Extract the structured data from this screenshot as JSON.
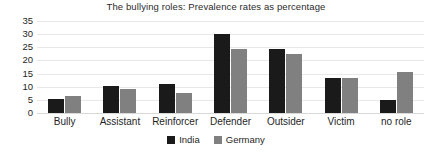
{
  "chart_data": {
    "type": "bar",
    "title": "The bullying roles: Prevalence rates as percentage",
    "xlabel": "",
    "ylabel": "",
    "categories": [
      "Bully",
      "Assistant",
      "Reinforcer",
      "Defender",
      "Outsider",
      "Victim",
      "no role"
    ],
    "series": [
      {
        "name": "India",
        "color": "#1a1a1a",
        "values": [
          5.3,
          10.2,
          11.0,
          30.0,
          24.5,
          13.5,
          4.8
        ]
      },
      {
        "name": "Germany",
        "color": "#808080",
        "values": [
          6.5,
          9.0,
          7.5,
          24.3,
          22.4,
          13.4,
          15.6
        ]
      }
    ],
    "ylim": [
      0,
      35
    ],
    "yticks": [
      0,
      5,
      10,
      15,
      20,
      25,
      30,
      35
    ],
    "ytick_labels": [
      "0",
      "5",
      "10",
      "15",
      "20",
      "25",
      "30",
      "35"
    ],
    "grid": true,
    "legend_position": "bottom"
  }
}
